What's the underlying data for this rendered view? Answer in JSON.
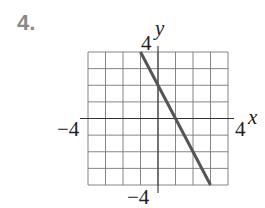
{
  "problem_number": "4.",
  "chart_data": {
    "type": "line",
    "title": "",
    "xlabel": "x",
    "ylabel": "y",
    "xlim": [
      -4,
      4
    ],
    "ylim": [
      -4,
      4
    ],
    "grid": true,
    "grid_step": 1,
    "tick_labels": {
      "x_min": "−4",
      "x_max": "4",
      "y_max": "4",
      "y_min": "−4"
    },
    "series": [
      {
        "name": "line",
        "x": [
          -1,
          0,
          1,
          2,
          3
        ],
        "y": [
          4,
          2,
          0,
          -2,
          -4
        ],
        "color": "#555555"
      }
    ],
    "equation_implied": "y = -2x + 2"
  }
}
